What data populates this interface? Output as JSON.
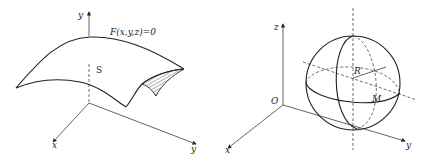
{
  "figures": [
    {
      "id": "surface",
      "axes": {
        "vertical": "y",
        "horizontal_left": "x",
        "horizontal_right": "y"
      },
      "equation_label": "F(x,y,z)=0",
      "surface_label": "S"
    },
    {
      "id": "sphere",
      "axes": {
        "vertical": "z",
        "left": "x",
        "right": "y"
      },
      "origin_label": "O",
      "radius_label": "R",
      "point_label": "M"
    }
  ]
}
